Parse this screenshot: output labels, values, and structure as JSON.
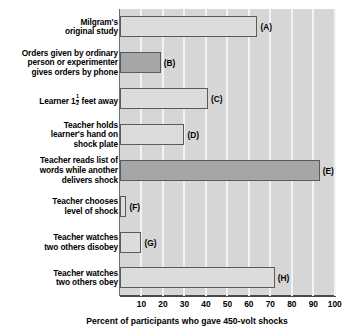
{
  "chart_data": {
    "type": "bar",
    "orientation": "horizontal",
    "title": "",
    "xlabel": "Percent of participants who gave 450-volt shocks",
    "ylabel": "",
    "xlim": [
      0,
      100
    ],
    "xticks": [
      10,
      20,
      30,
      40,
      50,
      60,
      70,
      80,
      90,
      100
    ],
    "grid": "vertical",
    "legend": "none",
    "categories": [
      "Milgram's original study",
      "Orders given by ordinary person or experimenter gives orders by phone",
      "Learner 1 1/2 feet away",
      "Teacher holds learner's hand on shock plate",
      "Teacher reads list of words while another delivers shock",
      "Teacher chooses level of shock",
      "Teacher watches two others disobey",
      "Teacher watches two others obey"
    ],
    "values": [
      64,
      19,
      41,
      30,
      93,
      3,
      10,
      72
    ],
    "point_labels": [
      "(A)",
      "(B)",
      "(C)",
      "(D)",
      "(E)",
      "(F)",
      "(G)",
      "(H)"
    ],
    "bars": [
      {
        "tag": "(A)",
        "value": 64,
        "fill": "light",
        "label_lines": [
          "Milgram's",
          "original study"
        ]
      },
      {
        "tag": "(B)",
        "value": 19,
        "fill": "dark",
        "label_lines": [
          "Orders given by ordinary",
          "person or experimenter",
          "gives orders by phone"
        ]
      },
      {
        "tag": "(C)",
        "value": 41,
        "fill": "light",
        "label_lines": [
          "Learner 1|FRAC| feet away"
        ],
        "fraction": {
          "numerator": "1",
          "denominator": "2"
        }
      },
      {
        "tag": "(D)",
        "value": 30,
        "fill": "light",
        "label_lines": [
          "Teacher holds",
          "learner's hand on",
          "shock plate"
        ]
      },
      {
        "tag": "(E)",
        "value": 93,
        "fill": "dark",
        "label_lines": [
          "Teacher reads list of",
          "words while another",
          "delivers shock"
        ]
      },
      {
        "tag": "(F)",
        "value": 3,
        "fill": "light",
        "label_lines": [
          "Teacher chooses",
          "level of shock"
        ]
      },
      {
        "tag": "(G)",
        "value": 10,
        "fill": "light",
        "label_lines": [
          "Teacher watches",
          "two others disobey"
        ]
      },
      {
        "tag": "(H)",
        "value": 72,
        "fill": "light",
        "label_lines": [
          "Teacher watches",
          "two others obey"
        ]
      }
    ],
    "colors": {
      "plot_background": "#d6d6d6",
      "gridline": "#f2f2f2",
      "bar_light": "#dcdcdc",
      "bar_dark": "#a6a6a6",
      "bar_border": "#5a5a5a",
      "axis": "#4a4a4a",
      "text": "#000000",
      "page_background": "#ffffff"
    }
  }
}
